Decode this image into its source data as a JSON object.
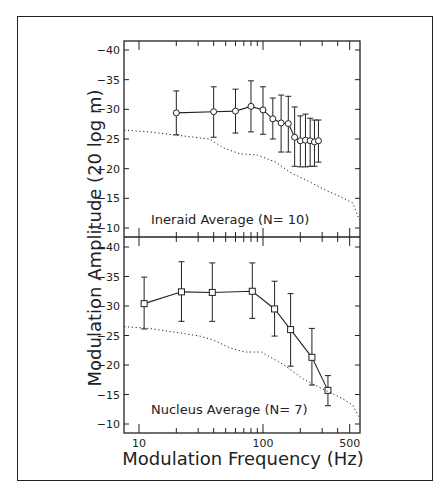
{
  "figure": {
    "ylabel": "Modulation Amplitude (20 log m)",
    "xlabel": "Modulation Frequency (Hz)",
    "x_tick_labels": [
      {
        "value": 10,
        "label": "10"
      },
      {
        "value": 100,
        "label": "100"
      },
      {
        "value": 500,
        "label": "500"
      }
    ],
    "y_tick_labels": [
      "-40",
      "-35",
      "-30",
      "-25",
      "-20",
      "-15",
      "-10"
    ]
  },
  "colors": {
    "ink": "#222222",
    "background": "#ffffff"
  },
  "chart_data": [
    {
      "type": "line",
      "title": "Ineraid Average (N= 10)",
      "xlabel": "Modulation Frequency (Hz)",
      "ylabel": "Modulation Amplitude (20 log m)",
      "xscale": "log",
      "xlim": [
        7.6,
        600
      ],
      "ylim": [
        -8,
        -41.5
      ],
      "y_inverted": true,
      "grid": false,
      "series": [
        {
          "name": "Ineraid average",
          "marker": "circle",
          "x": [
            20,
            40,
            60,
            80,
            100,
            120,
            140,
            160,
            180,
            200,
            220,
            240,
            260,
            280
          ],
          "y": [
            -29.4,
            -29.6,
            -29.7,
            -30.5,
            -29.9,
            -28.4,
            -27.7,
            -27.6,
            -25.3,
            -24.7,
            -24.8,
            -24.7,
            -24.5,
            -24.7
          ],
          "err_upper": [
            -33.1,
            -33.8,
            -33.4,
            -34.8,
            -33.8,
            -31.9,
            -32.4,
            -32.2,
            -30.4,
            -28.9,
            -29.2,
            -28.5,
            -28.2,
            -28.2
          ],
          "err_lower": [
            -25.7,
            -25.3,
            -26.0,
            -26.2,
            -25.8,
            -25.0,
            -22.8,
            -22.8,
            -20.4,
            -20.3,
            -20.3,
            -20.4,
            -20.4,
            -21.1
          ]
        },
        {
          "name": "Reference (dotted)",
          "style": "dotted",
          "x": [
            7.6,
            12,
            19,
            37,
            48,
            65,
            90,
            127,
            168,
            222,
            318,
            430,
            530,
            600
          ],
          "y": [
            -26.5,
            -26.2,
            -25.7,
            -25.0,
            -23.5,
            -22.5,
            -22.3,
            -21.1,
            -19.3,
            -18.1,
            -16.4,
            -15.2,
            -14.2,
            -11.3
          ]
        }
      ]
    },
    {
      "type": "line",
      "title": "Nucleus Average (N= 7)",
      "xlabel": "Modulation Frequency (Hz)",
      "ylabel": "Modulation Amplitude (20 log m)",
      "xscale": "log",
      "xlim": [
        7.6,
        600
      ],
      "ylim": [
        -8.5,
        -41.5
      ],
      "y_inverted": true,
      "grid": false,
      "series": [
        {
          "name": "Nucleus average",
          "marker": "square",
          "x": [
            11,
            22,
            39,
            82,
            124,
            167,
            248,
            334
          ],
          "y": [
            -30.4,
            -32.4,
            -32.3,
            -32.5,
            -29.5,
            -26.0,
            -21.3,
            -15.7
          ],
          "err_upper": [
            -34.9,
            -37.5,
            -37.3,
            -37.3,
            -34.2,
            -32.1,
            -26.2,
            -18.2
          ],
          "err_lower": [
            -26.1,
            -27.4,
            -27.4,
            -27.9,
            -24.9,
            -19.8,
            -16.6,
            -13.1
          ]
        },
        {
          "name": "Reference (dotted)",
          "style": "dotted",
          "x": [
            7.6,
            12,
            19,
            31,
            40,
            54,
            71,
            97,
            148,
            215,
            312,
            430,
            530,
            600
          ],
          "y": [
            -26.5,
            -26.2,
            -25.6,
            -24.9,
            -24.2,
            -22.9,
            -22.2,
            -22.2,
            -20.0,
            -17.5,
            -15.8,
            -14.4,
            -13.2,
            -11.0
          ]
        }
      ]
    }
  ]
}
